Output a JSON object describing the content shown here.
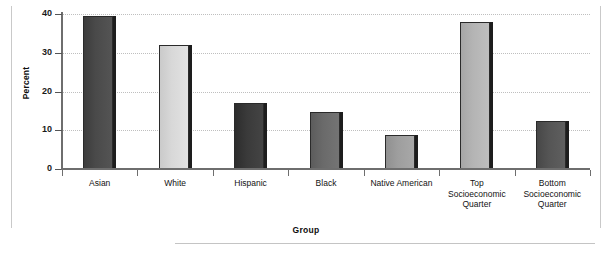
{
  "chart_data": {
    "type": "bar",
    "title": "",
    "xlabel": "Group",
    "ylabel": "Percent",
    "ylim": [
      0,
      40
    ],
    "yticks": [
      0,
      10,
      20,
      30,
      40
    ],
    "ytick_labels": [
      "0",
      "10",
      "20",
      "30",
      "40"
    ],
    "grid": "horizontal-dotted",
    "legend": "none",
    "categories": [
      "Asian",
      "White",
      "Hispanic",
      "Black",
      "Native American",
      "Top Socioeconomic Quarter",
      "Bottom Socioeconomic Quarter"
    ],
    "category_label_lines": [
      [
        "Asian"
      ],
      [
        "White"
      ],
      [
        "Hispanic"
      ],
      [
        "Black"
      ],
      [
        "Native American"
      ],
      [
        "Top",
        "Socioeconomic",
        "Quarter"
      ],
      [
        "Bottom",
        "Socioeconomic",
        "Quarter"
      ]
    ],
    "values": [
      39.4,
      32.1,
      17.0,
      14.6,
      8.7,
      38.0,
      12.3
    ],
    "bar_colors": [
      "#4a4a4a",
      "#d8d8d8",
      "#3a3a3a",
      "#6a6a6a",
      "#9e9e9e",
      "#b4b4b4",
      "#555555"
    ],
    "bar_shadow_color": "#1d1d1d",
    "bar_edge_color": "#2a2a2a",
    "axis_color": "#6e6e6e",
    "gridline_color": "#bfbfbf",
    "background": "#ffffff"
  }
}
